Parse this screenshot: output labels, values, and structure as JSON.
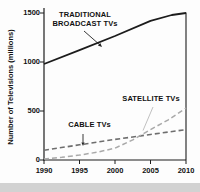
{
  "chart_data": {
    "type": "line",
    "title": "",
    "xlabel": "",
    "ylabel": "Number of Televisions (millions)",
    "xlim": [
      1990,
      2010
    ],
    "ylim": [
      0,
      1500
    ],
    "x_ticks": [
      1990,
      1995,
      2000,
      2005,
      2010
    ],
    "y_ticks": [
      0,
      500,
      1000,
      1500
    ],
    "grid": false,
    "legend": "inline-annotations",
    "axis_color": "#1d1d1d",
    "series": [
      {
        "name": "TRADITIONAL BROADCAST TVs",
        "key": "traditional",
        "style": "solid",
        "color": "#1c1c1c",
        "width": 1.8,
        "x": [
          1990,
          1995,
          2000,
          2005,
          2008,
          2010
        ],
        "values": [
          980,
          1120,
          1265,
          1420,
          1480,
          1500
        ]
      },
      {
        "name": "CABLE TVs",
        "key": "cable",
        "style": "dashed",
        "color": "#6e6e6e",
        "width": 1.6,
        "x": [
          1990,
          1995,
          2000,
          2005,
          2010
        ],
        "values": [
          100,
          155,
          210,
          260,
          310
        ]
      },
      {
        "name": "SATELLITE TVs",
        "key": "satellite",
        "style": "dashed",
        "color": "#a9a9a9",
        "width": 1.5,
        "x": [
          1990,
          1992.5,
          1995,
          1997.5,
          2000,
          2002.5,
          2005,
          2007.5,
          2010
        ],
        "values": [
          10,
          28,
          50,
          80,
          120,
          205,
          310,
          410,
          530
        ]
      }
    ],
    "annotations": [
      {
        "key": "traditional",
        "line1": "TRADITIONAL",
        "line2": "BROADCAST TVs"
      },
      {
        "key": "satellite",
        "text": "SATELLITE TVs"
      },
      {
        "key": "cable",
        "text": "CABLE TVs"
      }
    ]
  }
}
